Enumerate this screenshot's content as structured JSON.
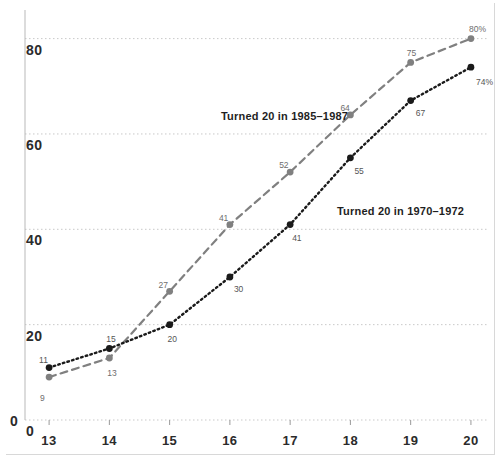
{
  "chart_data": {
    "type": "line",
    "title": "",
    "subtitle": "",
    "xlabel": "",
    "ylabel": "",
    "x": [
      13,
      14,
      15,
      16,
      17,
      18,
      19,
      20
    ],
    "xtick_labels": [
      "13",
      "14",
      "15",
      "16",
      "17",
      "18",
      "19",
      "20"
    ],
    "xlim": [
      12.6,
      20.3
    ],
    "ylim": [
      0,
      86
    ],
    "ytick_labels": [
      "0",
      "20",
      "40",
      "60",
      "80"
    ],
    "yticks": [
      0,
      20,
      40,
      60,
      80
    ],
    "grid": "horizontal-dotted",
    "legend_position": "inline-annotation",
    "origin_label": "0",
    "series": [
      {
        "name": "Turned 20 in 1985–1987",
        "values": [
          9,
          13,
          27,
          41,
          52,
          64,
          75,
          80
        ],
        "point_labels": [
          "9",
          "13",
          "27",
          "41",
          "52",
          "64",
          "75",
          "80%"
        ],
        "color": "#808080",
        "line_style": "dashed",
        "marker": "circle",
        "annotation": "Turned 20 in 1985–1987"
      },
      {
        "name": "Turned 20 in 1970–1972",
        "values": [
          11,
          15,
          20,
          30,
          41,
          55,
          67,
          74
        ],
        "point_labels": [
          "11",
          "15",
          "20",
          "30",
          "41",
          "55",
          "67",
          "74%"
        ],
        "color": "#1a1a1a",
        "line_style": "dotted",
        "marker": "circle",
        "annotation": "Turned 20 in 1970–1972"
      }
    ],
    "colors": {
      "gridline": "#c9c9c9",
      "axis": "#b9b9b9",
      "tick_text": "#2b2b2b",
      "label_text": "#6e6e6e",
      "background": "#ffffff"
    }
  }
}
